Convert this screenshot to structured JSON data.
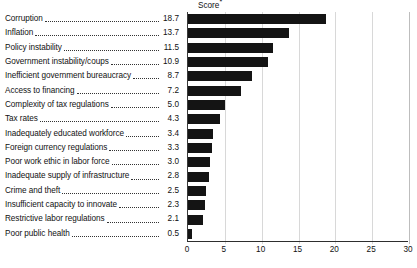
{
  "chart_data": {
    "type": "bar",
    "orientation": "horizontal",
    "title": "Score*",
    "title_text": "Score",
    "title_superscript": "*",
    "xlabel": "",
    "ylabel": "",
    "xlim": [
      0,
      30
    ],
    "xticks": [
      0,
      5,
      10,
      15,
      20,
      25,
      30
    ],
    "xtick_labels": [
      "0",
      "5",
      "10",
      "15",
      "20",
      "25",
      "30"
    ],
    "grid": true,
    "grid_axis": "x",
    "legend": null,
    "bar_color": "#141414",
    "categories": [
      "Corruption",
      "Inflation",
      "Policy instability",
      "Government instability/coups",
      "Inefficient government bureaucracy",
      "Access to financing",
      "Complexity of tax regulations",
      "Tax rates",
      "Inadequately educated workforce",
      "Foreign currency regulations",
      "Poor work ethic in labor force",
      "Inadequate supply of infrastructure",
      "Crime and theft",
      "Insufficient capacity to innovate",
      "Restrictive labor regulations",
      "Poor public health"
    ],
    "values": [
      18.7,
      13.7,
      11.5,
      10.9,
      8.7,
      7.2,
      5.0,
      4.3,
      3.4,
      3.3,
      3.0,
      2.8,
      2.5,
      2.3,
      2.1,
      0.5
    ],
    "value_labels": [
      "18.7",
      "13.7",
      "11.5",
      "10.9",
      "8.7",
      "7.2",
      "5.0",
      "4.3",
      "3.4",
      "3.3",
      "3.0",
      "2.8",
      "2.5",
      "2.3",
      "2.1",
      "0.5"
    ]
  }
}
